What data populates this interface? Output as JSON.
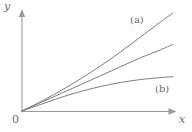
{
  "figure": {
    "background_color": "#ffffff",
    "axis_color": "#9a9a9a",
    "curve_color": "#6e6e6e",
    "text_color": "#6b6b6b",
    "origin_label": "0",
    "x_axis_label": "x",
    "y_axis_label": "y"
  },
  "chart_data": {
    "type": "line",
    "title": "",
    "subtitle": "",
    "xlabel": "x",
    "ylabel": "y",
    "xlim": [
      0,
      1
    ],
    "ylim": [
      0,
      1
    ],
    "grid": false,
    "legend": "inline-annotations",
    "axis_style": "arrow-headed axes meeting at origin labeled 0",
    "origin_label": "0",
    "annotations": [
      {
        "text": "(a)",
        "x": 0.72,
        "y": 0.93,
        "describes": "upper curve"
      },
      {
        "text": "(b)",
        "x": 0.88,
        "y": 0.25,
        "describes": "lower curve"
      }
    ],
    "series": [
      {
        "name": "(a)",
        "label": "(a)",
        "shape": "slightly convex increasing (superlinear)",
        "x": [
          0.0,
          0.13,
          0.26,
          0.39,
          0.52,
          0.65,
          0.78,
          0.91,
          1.0
        ],
        "y": [
          0.0,
          0.1,
          0.21,
          0.33,
          0.46,
          0.6,
          0.75,
          0.9,
          1.0
        ]
      },
      {
        "name": "middle",
        "label": "",
        "shape": "nearly straight increasing (linear)",
        "x": [
          0.0,
          0.13,
          0.26,
          0.39,
          0.52,
          0.65,
          0.78,
          0.91,
          1.0
        ],
        "y": [
          0.0,
          0.09,
          0.18,
          0.27,
          0.36,
          0.45,
          0.54,
          0.62,
          0.68
        ]
      },
      {
        "name": "(b)",
        "label": "(b)",
        "shape": "concave increasing, saturating (sublinear)",
        "x": [
          0.0,
          0.13,
          0.26,
          0.39,
          0.52,
          0.65,
          0.78,
          0.91,
          1.0
        ],
        "y": [
          0.0,
          0.07,
          0.14,
          0.2,
          0.25,
          0.29,
          0.32,
          0.34,
          0.35
        ]
      }
    ]
  }
}
